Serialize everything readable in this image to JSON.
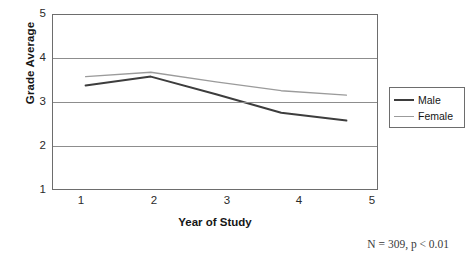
{
  "chart_data": {
    "type": "line",
    "title": "",
    "xlabel": "Year of Study",
    "ylabel": "Grade Average",
    "x": [
      1,
      2,
      3,
      4,
      5
    ],
    "categories": [
      "1",
      "2",
      "3",
      "4",
      "5"
    ],
    "xlim": [
      0.5,
      5.5
    ],
    "ylim": [
      1,
      5
    ],
    "yticks": [
      1,
      2,
      3,
      4,
      5
    ],
    "ytick_labels": [
      "1",
      "2",
      "3",
      "4",
      "5"
    ],
    "xtick_labels": [
      "1",
      "2",
      "3",
      "4",
      "5"
    ],
    "grid": "horizontal",
    "legend_position": "right",
    "series": [
      {
        "name": "Male",
        "values": [
          3.4,
          3.6,
          3.2,
          2.78,
          2.6
        ],
        "color": "#3d3d3d",
        "line_width": 2.0
      },
      {
        "name": "Female",
        "values": [
          3.6,
          3.7,
          3.48,
          3.28,
          3.18
        ],
        "color": "#9b9b9b",
        "line_width": 1.4
      }
    ],
    "annotations": [
      {
        "text": "N = 309, p < 0.01",
        "position": "bottom-right"
      }
    ]
  },
  "axes": {
    "y_title": "Grade Average",
    "x_title": "Year of Study",
    "y_tick_labels": [
      "5",
      "4",
      "3",
      "2",
      "1"
    ],
    "x_tick_labels": [
      "1",
      "2",
      "3",
      "4",
      "5"
    ]
  },
  "legend": {
    "entries": [
      {
        "label": "Male",
        "color": "#3d3d3d",
        "width": "2px"
      },
      {
        "label": "Female",
        "color": "#9b9b9b",
        "width": "1.3px"
      }
    ]
  },
  "footnote": {
    "text": "N = 309, p < 0.01"
  },
  "colors": {
    "male_line": "#3d3d3d",
    "female_line": "#9b9b9b",
    "axis": "#6d6d6d",
    "gridline": "#8d8d8d",
    "background": "#ffffff"
  }
}
